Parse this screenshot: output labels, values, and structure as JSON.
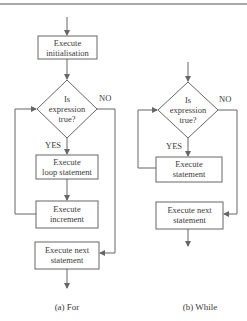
{
  "figure": {
    "for_loop": {
      "caption": "(a) For",
      "nodes": {
        "init": {
          "line1": "Execute",
          "line2": "initialisation"
        },
        "condition": {
          "line1": "Is",
          "line2": "expression",
          "line3": "true?"
        },
        "body": {
          "line1": "Execute",
          "line2": "loop statement"
        },
        "increment": {
          "line1": "Execute",
          "line2": "increment"
        },
        "next": {
          "line1": "Execute next",
          "line2": "statement"
        }
      },
      "labels": {
        "yes": "YES",
        "no": "NO"
      }
    },
    "while_loop": {
      "caption": "(b) While",
      "nodes": {
        "condition": {
          "line1": "Is",
          "line2": "expression",
          "line3": "true?"
        },
        "body": {
          "line1": "Execute",
          "line2": "statement"
        },
        "next": {
          "line1": "Execute next",
          "line2": "statement"
        }
      },
      "labels": {
        "yes": "YES",
        "no": "NO"
      }
    },
    "colors": {
      "stroke": "#666666",
      "text": "#3a3a3a",
      "rule": "#a8a8a8"
    }
  }
}
